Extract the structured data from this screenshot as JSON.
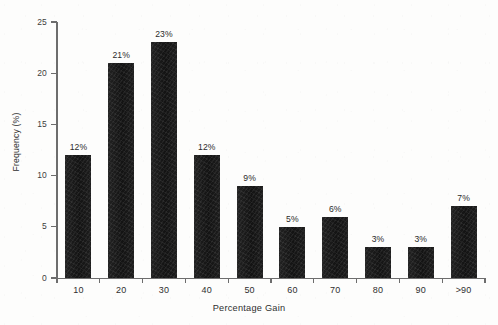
{
  "chart_data": {
    "type": "bar",
    "title": "",
    "xlabel": "Percentage Gain",
    "ylabel": "Frequency (%)",
    "categories": [
      "10",
      "20",
      "30",
      "40",
      "50",
      "60",
      "70",
      "80",
      "90",
      ">90"
    ],
    "values": [
      12,
      21,
      23,
      12,
      9,
      5,
      6,
      3,
      3,
      7
    ],
    "data_labels": [
      "12%",
      "21%",
      "23%",
      "12%",
      "9%",
      "5%",
      "6%",
      "3%",
      "3%",
      "7%"
    ],
    "ylim": [
      0,
      25
    ],
    "y_ticks": [
      0,
      5,
      10,
      15,
      20,
      25
    ],
    "y_tick_labels": [
      "0",
      "5",
      "10",
      "15",
      "20",
      "25"
    ],
    "grid": false,
    "legend": false,
    "bar_color": "#161616",
    "axis_color": "#6d6d6d",
    "text_color": "#2f2f2f",
    "background_color": "#fdfdfc"
  }
}
